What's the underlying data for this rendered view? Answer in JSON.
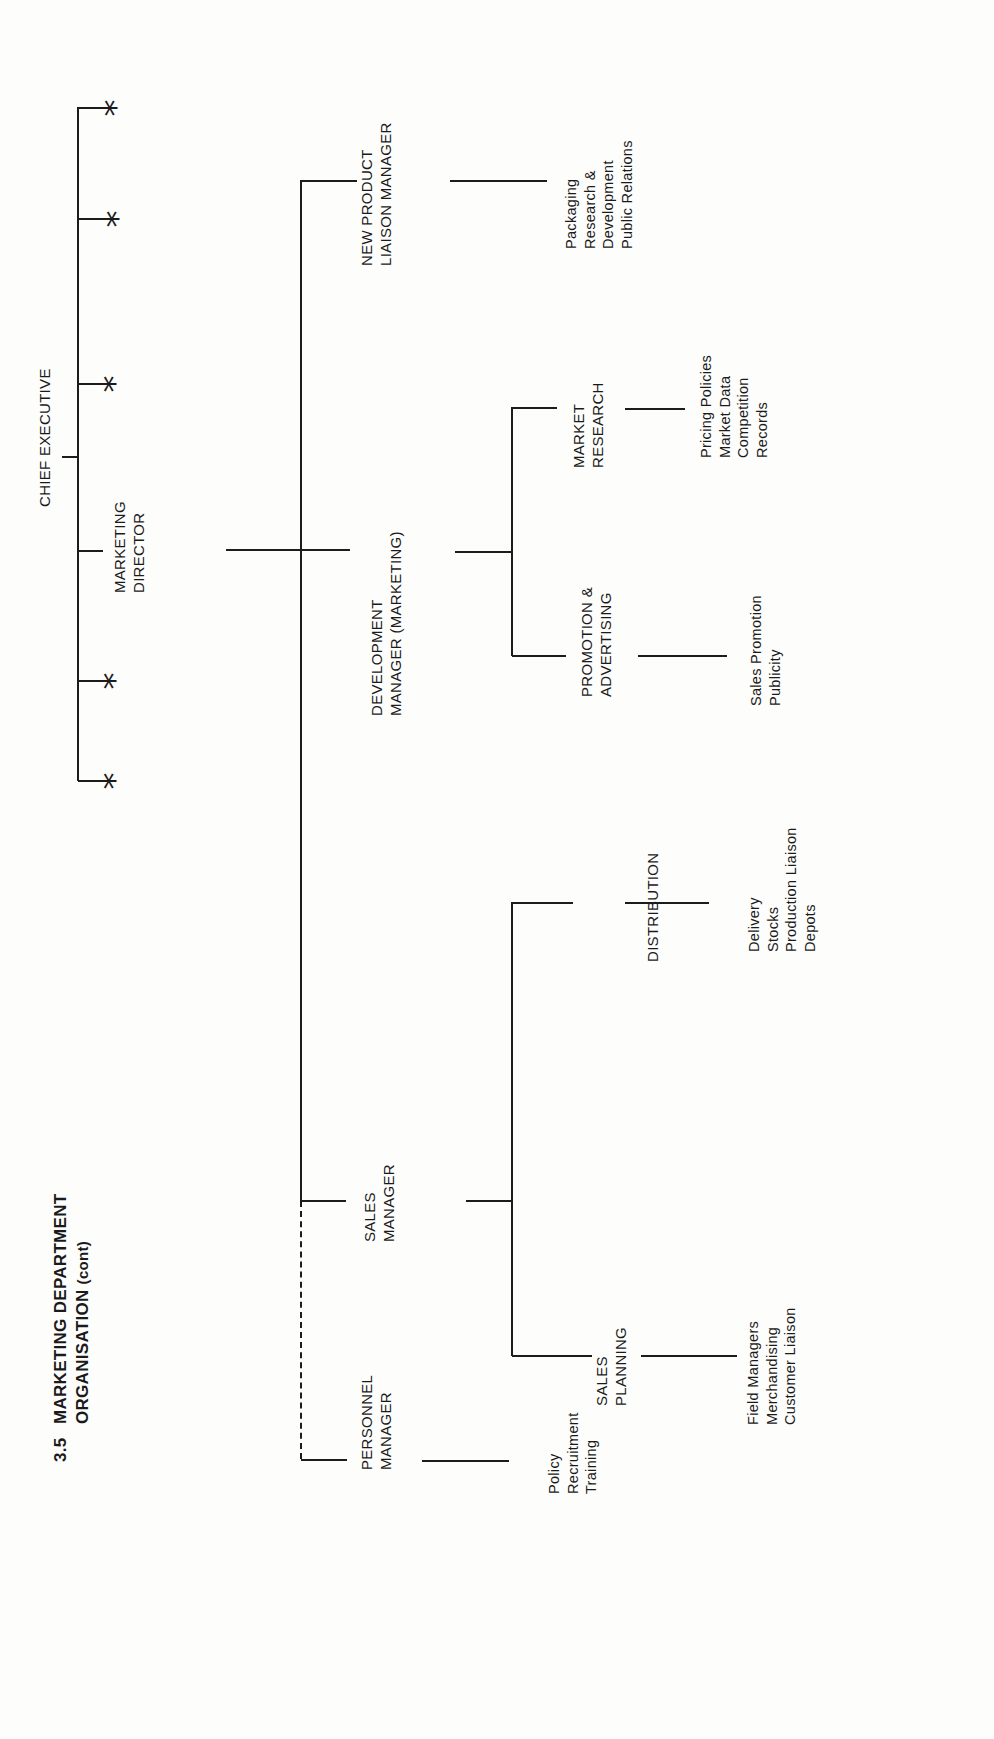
{
  "title": {
    "number": "3.5",
    "line1": "MARKETING DEPARTMENT",
    "line2": "ORGANISATION",
    "suffix": "(cont)"
  },
  "chief_executive": {
    "label": "CHIEF EXECUTIVE",
    "other_reports_marker": "*"
  },
  "marketing_director": {
    "line1": "MARKETING",
    "line2": "DIRECTOR"
  },
  "departments": {
    "new_product": {
      "line1": "NEW PRODUCT",
      "line2": "LIAISON MANAGER",
      "duties": [
        "Packaging",
        "Research &",
        "Development",
        "Public Relations"
      ]
    },
    "development": {
      "line1": "DEVELOPMENT",
      "line2": "MANAGER (MARKETING)",
      "sections": {
        "market_research": {
          "line1": "MARKET",
          "line2": "RESEARCH",
          "duties": [
            "Pricing Policies",
            "Market Data",
            "Competition",
            "Records"
          ]
        },
        "promotion": {
          "line1": "PROMOTION &",
          "line2": "ADVERTISING",
          "duties": [
            "Sales Promotion",
            "Publicity"
          ]
        }
      }
    },
    "sales": {
      "line1": "SALES",
      "line2": "MANAGER",
      "sections": {
        "distribution": {
          "line1": "DISTRIBUTION",
          "duties": [
            "Delivery",
            "Stocks",
            "Production Liaison",
            "Depots"
          ]
        },
        "sales_planning": {
          "line1": "SALES",
          "line2": "PLANNING",
          "duties": [
            "Field Managers",
            "Merchandising",
            "Customer Liaison"
          ]
        }
      }
    },
    "personnel": {
      "line1": "PERSONNEL",
      "line2": "MANAGER",
      "duties": [
        "Policy",
        "Recruitment",
        "Training"
      ]
    }
  },
  "colors": {
    "ink": "#1c1c1c",
    "paper": "#fdfdfc"
  }
}
